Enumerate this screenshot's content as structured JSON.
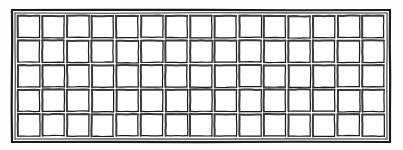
{
  "figure": {
    "style": "ink line drawing",
    "background_color": "#fefefe",
    "ink_color": "#1a1a1a",
    "shadow_color": "#3a3a3a",
    "light_color": "#8a8a8a"
  },
  "panel": {
    "name": "lattice-panel",
    "x": 12,
    "y": 10,
    "width": 378,
    "height": 132,
    "frame": {
      "name": "outer-frame",
      "outer_stroke_width": 2.2,
      "inner_stroke_width": 1.1,
      "inset": 3
    }
  },
  "grid": {
    "columns": 15,
    "rows": 5,
    "cell_width": 25.2,
    "cell_height": 26.4,
    "cell_inset": 3.2,
    "total_cells": 75
  },
  "cells": {
    "stroke_width": 1.2,
    "shadow_stroke_width": 2.0,
    "fill": "#ffffff",
    "shadow_edges": [
      "top",
      "left"
    ],
    "light_edges": [
      "bottom",
      "right"
    ]
  },
  "labels": {
    "panel_label": "",
    "caption": ""
  }
}
